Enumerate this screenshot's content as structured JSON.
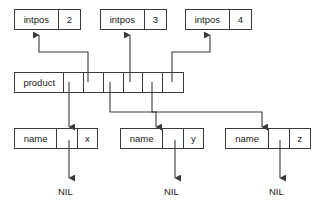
{
  "diagram": {
    "type": "linked-structure-memory-diagram",
    "stroke_color": "#3a3a3a",
    "text_color": "#1a1a1a",
    "background": "#ffffff",
    "intpos_nodes": [
      {
        "label": "intpos",
        "value": "2"
      },
      {
        "label": "intpos",
        "value": "3"
      },
      {
        "label": "intpos",
        "value": "4"
      }
    ],
    "product_node": {
      "label": "product",
      "pointer_cell_count": 6
    },
    "name_nodes": [
      {
        "label": "name",
        "value": "x"
      },
      {
        "label": "name",
        "value": "y"
      },
      {
        "label": "name",
        "value": "z"
      }
    ],
    "nil_labels": [
      "NIL",
      "NIL",
      "NIL"
    ]
  }
}
